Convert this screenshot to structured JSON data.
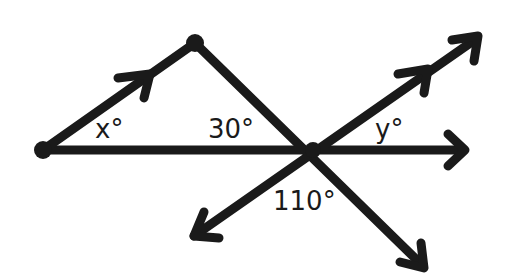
{
  "diagram": {
    "type": "geometry-angles",
    "stroke_color": "#1a1a1a",
    "background": "#ffffff",
    "points": {
      "left_vertex": [
        43,
        150
      ],
      "top_vertex": [
        195,
        43
      ],
      "intersection": [
        313,
        150
      ]
    },
    "labels": {
      "angle_x": "x°",
      "angle_30": "30°",
      "angle_y": "y°",
      "angle_110": "110°"
    }
  }
}
